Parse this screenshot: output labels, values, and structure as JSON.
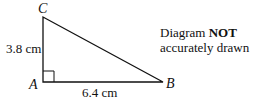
{
  "diagram": {
    "type": "right-triangle",
    "vertices": {
      "A": {
        "label": "A",
        "x": 43,
        "y": 82
      },
      "B": {
        "label": "B",
        "x": 163,
        "y": 82
      },
      "C": {
        "label": "C",
        "x": 43,
        "y": 17
      }
    },
    "right_angle_at": "A",
    "sides": {
      "AC": {
        "label": "3.8 cm"
      },
      "AB": {
        "label": "6.4 cm"
      }
    },
    "note": {
      "prefix": "Diagram ",
      "emphasis": "NOT",
      "suffix": "accurately drawn"
    }
  }
}
